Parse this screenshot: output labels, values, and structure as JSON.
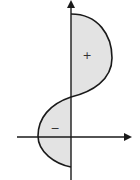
{
  "diagram": {
    "labels": {
      "positive_region": "+",
      "negative_region": "−"
    },
    "colors": {
      "fill": "#e3e3e3",
      "stroke": "#1a1a1a",
      "background": "#ffffff"
    }
  }
}
